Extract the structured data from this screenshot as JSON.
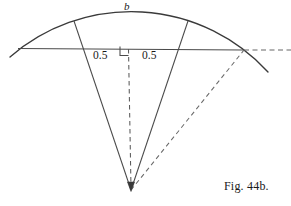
{
  "figure": {
    "caption": "Fig. 44b.",
    "arc_label": "b",
    "segment_label_left": "0.5",
    "segment_label_right": "0.5",
    "colors": {
      "stroke": "#3a3a3a",
      "dashed": "#555555",
      "background": "#ffffff",
      "text": "#1a1a1a"
    },
    "geometry": {
      "vertex": [
        131,
        190
      ],
      "arc_start": [
        10,
        57
      ],
      "arc_end": [
        268,
        72
      ],
      "arc_top": [
        130,
        16
      ],
      "chord_start": [
        18,
        48
      ],
      "chord_end": [
        244,
        50
      ],
      "chord_dash_end": [
        291,
        50
      ],
      "radius_left_top": [
        74,
        21
      ],
      "radius_right_top": [
        188,
        21
      ],
      "center_line_top": [
        128,
        50
      ],
      "right_angle_marker": [
        120,
        46,
        9,
        9
      ],
      "diagonal_dashed_end": [
        244,
        50
      ]
    }
  }
}
